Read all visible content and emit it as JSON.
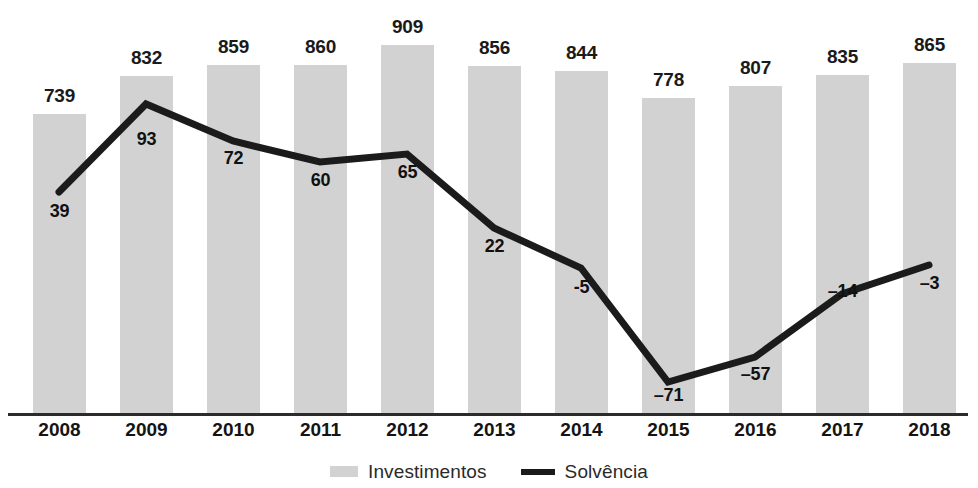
{
  "chart_data": {
    "type": "bar",
    "title": "",
    "subtitle": "",
    "xlabel": "",
    "ylabel": "",
    "grid": false,
    "legend_position": "bottom-center",
    "categories": [
      "2008",
      "2009",
      "2010",
      "2011",
      "2012",
      "2013",
      "2014",
      "2015",
      "2016",
      "2017",
      "2018"
    ],
    "series": [
      {
        "name": "Investimentos",
        "type": "bar",
        "color": "#d2d2d2",
        "values": [
          739,
          832,
          859,
          860,
          909,
          856,
          844,
          778,
          807,
          835,
          865
        ],
        "labels": [
          "739",
          "832",
          "859",
          "860",
          "909",
          "856",
          "844",
          "778",
          "807",
          "835",
          "865"
        ]
      },
      {
        "name": "Solvência",
        "type": "line",
        "color": "#1b1b1b",
        "values": [
          39,
          93,
          72,
          60,
          65,
          22,
          -5,
          -71,
          -57,
          -14,
          -3
        ],
        "labels": [
          "39",
          "93",
          "72",
          "60",
          "65",
          "22",
          "-5",
          "–71",
          "–57",
          "–14",
          "–3"
        ]
      }
    ],
    "bar_axis_range": [
      0,
      1022
    ],
    "line_axis_range": [
      -93,
      105
    ]
  },
  "legend": {
    "items": [
      {
        "label": "Investimentos",
        "swatch": "bar-swatch"
      },
      {
        "label": "Solvência",
        "swatch": "line-swatch"
      }
    ]
  },
  "bars": [
    {
      "category": "2008",
      "label": "739",
      "x": 33,
      "width": 53,
      "top": 114,
      "label_x": 33,
      "label_y": 85
    },
    {
      "category": "2009",
      "label": "832",
      "x": 120,
      "width": 53,
      "top": 76,
      "label_x": 120,
      "label_y": 47
    },
    {
      "category": "2010",
      "label": "859",
      "x": 207,
      "width": 53,
      "top": 65,
      "label_x": 207,
      "label_y": 36
    },
    {
      "category": "2011",
      "label": "860",
      "x": 294,
      "width": 53,
      "top": 65,
      "label_x": 294,
      "label_y": 36
    },
    {
      "category": "2012",
      "label": "909",
      "x": 381,
      "width": 53,
      "top": 45,
      "label_x": 381,
      "label_y": 16
    },
    {
      "category": "2013",
      "label": "856",
      "x": 468,
      "width": 53,
      "top": 66,
      "label_x": 468,
      "label_y": 37
    },
    {
      "category": "2014",
      "label": "844",
      "x": 555,
      "width": 53,
      "top": 71,
      "label_x": 555,
      "label_y": 42
    },
    {
      "category": "2015",
      "label": "778",
      "x": 642,
      "width": 53,
      "top": 98,
      "label_x": 642,
      "label_y": 69
    },
    {
      "category": "2016",
      "label": "807",
      "x": 729,
      "width": 53,
      "top": 86,
      "label_x": 729,
      "label_y": 57
    },
    {
      "category": "2017",
      "label": "835",
      "x": 816,
      "width": 53,
      "top": 75,
      "label_x": 816,
      "label_y": 46
    },
    {
      "category": "2018",
      "label": "865",
      "x": 903,
      "width": 53,
      "top": 63,
      "label_x": 903,
      "label_y": 34
    }
  ],
  "line_points": [
    {
      "category": "2008",
      "label": "39",
      "cx": 59,
      "cy": 192,
      "label_x": 33,
      "label_y": 201
    },
    {
      "category": "2009",
      "label": "93",
      "cx": 146,
      "cy": 104,
      "label_x": 120,
      "label_y": 129
    },
    {
      "category": "2010",
      "label": "72",
      "cx": 233,
      "cy": 141,
      "label_x": 207,
      "label_y": 148
    },
    {
      "category": "2011",
      "label": "60",
      "cx": 320,
      "cy": 162,
      "label_x": 294,
      "label_y": 170
    },
    {
      "category": "2012",
      "label": "65",
      "cx": 407,
      "cy": 154,
      "label_x": 381,
      "label_y": 162
    },
    {
      "category": "2013",
      "label": "22",
      "cx": 494,
      "cy": 228,
      "label_x": 468,
      "label_y": 236
    },
    {
      "category": "2014",
      "label": "-5",
      "cx": 581,
      "cy": 268,
      "label_x": 555,
      "label_y": 277
    },
    {
      "category": "2015",
      "label": "–71",
      "cx": 668,
      "cy": 382,
      "label_x": 642,
      "label_y": 385
    },
    {
      "category": "2016",
      "label": "–57",
      "cx": 755,
      "cy": 357,
      "label_x": 729,
      "label_y": 364
    },
    {
      "category": "2017",
      "label": "–14",
      "cx": 842,
      "cy": 294,
      "label_x": 816,
      "label_y": 281
    },
    {
      "category": "2018",
      "label": "–3",
      "cx": 929,
      "cy": 265,
      "label_x": 903,
      "label_y": 273
    }
  ],
  "x_ticks": [
    {
      "label": "2008",
      "x": 33
    },
    {
      "label": "2009",
      "x": 120
    },
    {
      "label": "2010",
      "x": 207
    },
    {
      "label": "2011",
      "x": 294
    },
    {
      "label": "2012",
      "x": 381
    },
    {
      "label": "2013",
      "x": 468
    },
    {
      "label": "2014",
      "x": 555
    },
    {
      "label": "2015",
      "x": 642
    },
    {
      "label": "2016",
      "x": 729
    },
    {
      "label": "2017",
      "x": 816
    },
    {
      "label": "2018",
      "x": 903
    }
  ],
  "colors": {
    "bar": "#d2d2d2",
    "line": "#1b1b1b",
    "axis": "#2b2b2b",
    "text": "#141414",
    "background": "#ffffff"
  }
}
